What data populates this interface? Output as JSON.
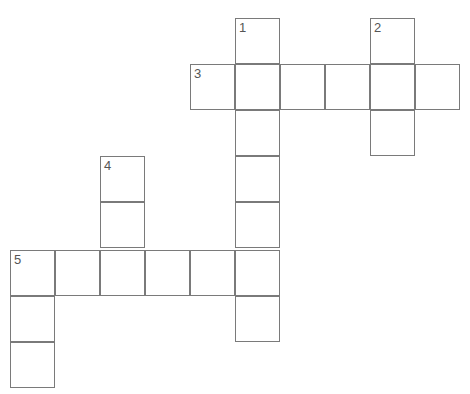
{
  "puzzle": {
    "type": "crossword",
    "cell_size": 45,
    "origin": {
      "x": 10,
      "y": 18
    },
    "cells": [
      {
        "c": 5,
        "r": 0,
        "n": "1"
      },
      {
        "c": 8,
        "r": 0,
        "n": "2"
      },
      {
        "c": 4,
        "r": 1,
        "n": "3"
      },
      {
        "c": 5,
        "r": 1
      },
      {
        "c": 6,
        "r": 1
      },
      {
        "c": 7,
        "r": 1
      },
      {
        "c": 8,
        "r": 1
      },
      {
        "c": 9,
        "r": 1
      },
      {
        "c": 5,
        "r": 2
      },
      {
        "c": 8,
        "r": 2
      },
      {
        "c": 2,
        "r": 3,
        "n": "4"
      },
      {
        "c": 5,
        "r": 3
      },
      {
        "c": 2,
        "r": 4
      },
      {
        "c": 5,
        "r": 4
      },
      {
        "c": 0,
        "r": 5,
        "n": "5"
      },
      {
        "c": 1,
        "r": 5
      },
      {
        "c": 2,
        "r": 5
      },
      {
        "c": 3,
        "r": 5
      },
      {
        "c": 4,
        "r": 5
      },
      {
        "c": 5,
        "r": 5
      },
      {
        "c": 0,
        "r": 6
      },
      {
        "c": 5,
        "r": 6
      },
      {
        "c": 0,
        "r": 7
      }
    ],
    "clues": [
      {
        "number": "1",
        "direction": "down",
        "length": 7
      },
      {
        "number": "2",
        "direction": "down",
        "length": 3
      },
      {
        "number": "3",
        "direction": "across",
        "length": 6
      },
      {
        "number": "4",
        "direction": "down",
        "length": 3
      },
      {
        "number": "5",
        "direction": "across",
        "length": 6
      },
      {
        "number": "5",
        "direction": "down",
        "length": 3
      }
    ]
  }
}
